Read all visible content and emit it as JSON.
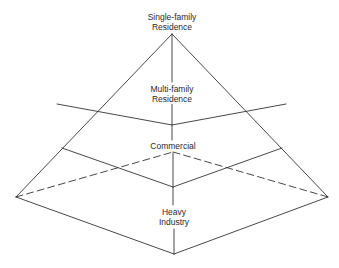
{
  "diagram": {
    "type": "pyramid",
    "colors": {
      "line": "#333333",
      "text": "#2a2a2a",
      "background": "#ffffff"
    },
    "tiers": [
      {
        "line1": "Single-family",
        "line2": "Residence"
      },
      {
        "line1": "Multi-family",
        "line2": "Residence"
      },
      {
        "line1": "Commercial"
      },
      {
        "line1": "Heavy",
        "line2": "Industry"
      }
    ]
  }
}
